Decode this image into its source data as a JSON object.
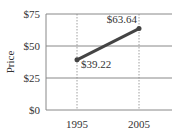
{
  "chart_data": {
    "type": "line",
    "title": "",
    "xlabel": "",
    "ylabel": "Price",
    "categories": [
      "1995",
      "2005"
    ],
    "x": [
      1995,
      2005
    ],
    "series": [
      {
        "name": "Price",
        "values": [
          39.22,
          63.64
        ],
        "color": "#444444"
      }
    ],
    "data_labels": [
      "$39.22",
      "$63.64"
    ],
    "y_ticks": [
      "$0",
      "$25",
      "$50",
      "$75"
    ],
    "y_tick_values": [
      0,
      25,
      50,
      75
    ],
    "ylim": [
      0,
      75
    ],
    "grid": {
      "horizontal": true,
      "vertical_dashed": true
    },
    "legend": null
  }
}
